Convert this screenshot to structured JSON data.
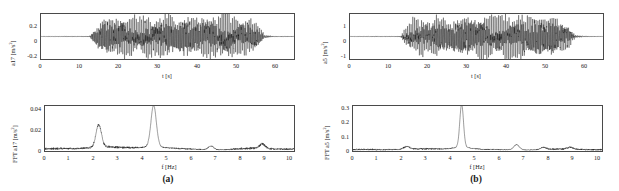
{
  "figure": {
    "caption_a": "(a)",
    "caption_b": "(b)"
  },
  "chart_data": [
    {
      "id": "a17-time",
      "type": "line",
      "title": "",
      "xlabel": "t [s]",
      "ylabel": "a17 [m/s²]",
      "ylabel_base": "a17 [m/s",
      "ylabel_exp": "2",
      "ylabel_tail": "]",
      "xlim": [
        0,
        65
      ],
      "ylim": [
        -0.36,
        0.36
      ],
      "xticks": [
        0,
        10,
        20,
        30,
        40,
        50,
        60
      ],
      "yticks": [
        0.2,
        0,
        -0.2
      ],
      "ytick_labels": [
        "0.2",
        "0",
        "-0.2"
      ],
      "grid": false,
      "description": "Acceleration time history; quiescent until ~13 s, strong broadband oscillation 13-57 s, peak amplitude about 0.3 m/s2, then decays to zero",
      "envelope_x": [
        0,
        12.5,
        13.5,
        15,
        17,
        19,
        21,
        23,
        25,
        27,
        29,
        31,
        33,
        35,
        37,
        39,
        41,
        43,
        45,
        47,
        49,
        51,
        53,
        55,
        56.5,
        57.5,
        60,
        65
      ],
      "envelope_y": [
        0.004,
        0.006,
        0.09,
        0.2,
        0.27,
        0.24,
        0.3,
        0.26,
        0.23,
        0.28,
        0.22,
        0.26,
        0.3,
        0.25,
        0.29,
        0.24,
        0.27,
        0.3,
        0.25,
        0.31,
        0.27,
        0.23,
        0.26,
        0.2,
        0.1,
        0.02,
        0.006,
        0.005
      ],
      "carrier_hz": 4.45
    },
    {
      "id": "a5-time",
      "type": "line",
      "title": "",
      "xlabel": "t [s]",
      "ylabel": "a5 [m/s²]",
      "ylabel_base": "a5 [m/s",
      "ylabel_exp": "2",
      "ylabel_tail": "]",
      "xlim": [
        0,
        65
      ],
      "ylim": [
        -1.8,
        1.8
      ],
      "xticks": [
        0,
        10,
        20,
        30,
        40,
        50,
        60
      ],
      "yticks": [
        1,
        0,
        -1
      ],
      "ytick_labels": [
        "1",
        "0",
        "-1"
      ],
      "grid": false,
      "description": "Acceleration time history; flat until ~13.5 s, sustained oscillation to ~57 s with peak amplitude about 1.5 m/s2",
      "envelope_x": [
        0,
        13,
        14,
        16,
        18,
        20,
        22,
        24,
        26,
        28,
        30,
        32,
        34,
        36,
        38,
        40,
        42,
        44,
        46,
        48,
        50,
        52,
        54,
        56,
        57,
        58,
        61,
        65
      ],
      "envelope_y": [
        0.02,
        0.03,
        0.45,
        1.05,
        1.25,
        1.1,
        1.35,
        1.15,
        1.0,
        1.3,
        1.45,
        1.25,
        1.4,
        1.5,
        1.3,
        1.45,
        1.35,
        1.5,
        1.3,
        1.45,
        1.25,
        1.4,
        1.15,
        0.8,
        0.35,
        0.08,
        0.03,
        0.02
      ],
      "carrier_hz": 4.45
    },
    {
      "id": "a17-fft",
      "type": "line",
      "title": "",
      "xlabel": "f [Hz]",
      "ylabel": "FFT a17 [m/s²]",
      "ylabel_base": "FFT a17 [m/s",
      "ylabel_exp": "2",
      "ylabel_tail": "]",
      "xlim": [
        0,
        10.2
      ],
      "ylim": [
        0,
        0.049
      ],
      "xticks": [
        0,
        1,
        2,
        3,
        4,
        5,
        6,
        7,
        8,
        9,
        10
      ],
      "yticks": [
        0,
        0.02,
        0.04
      ],
      "ytick_labels": [
        "0",
        "0.02",
        "0.04"
      ],
      "grid": false,
      "description": "Amplitude spectrum with a sharp peak at 2.2 Hz (0.024) and a dominant peak at 4.45 Hz (0.045); low broadband content elsewhere with mild bumps near 6.8 and 8.9 Hz",
      "peaks": [
        {
          "f": 2.2,
          "amp": 0.024
        },
        {
          "f": 4.45,
          "amp": 0.045
        },
        {
          "f": 6.8,
          "amp": 0.004
        },
        {
          "f": 8.9,
          "amp": 0.005
        }
      ],
      "baseline": 0.0015
    },
    {
      "id": "a5-fft",
      "type": "line",
      "title": "",
      "xlabel": "f [Hz]",
      "ylabel": "FFT a5 [m/s²]",
      "ylabel_base": "FFT a5 [m/s",
      "ylabel_exp": "2",
      "ylabel_tail": "]",
      "xlim": [
        0,
        10.2
      ],
      "ylim": [
        0,
        0.36
      ],
      "xticks": [
        0,
        1,
        2,
        3,
        4,
        5,
        6,
        7,
        8,
        9,
        10
      ],
      "yticks": [
        0,
        0.1,
        0.2,
        0.3
      ],
      "ytick_labels": [
        "0",
        "0.1",
        "0.2",
        "0.3"
      ],
      "grid": false,
      "description": "Amplitude spectrum dominated by a single sharp peak at 4.45 Hz reaching 0.34; small peaks at 2.2 Hz and 6.7 Hz",
      "peaks": [
        {
          "f": 2.2,
          "amp": 0.022
        },
        {
          "f": 4.45,
          "amp": 0.34
        },
        {
          "f": 6.7,
          "amp": 0.042
        },
        {
          "f": 7.8,
          "amp": 0.018
        },
        {
          "f": 8.9,
          "amp": 0.016
        }
      ],
      "baseline": 0.008
    }
  ]
}
